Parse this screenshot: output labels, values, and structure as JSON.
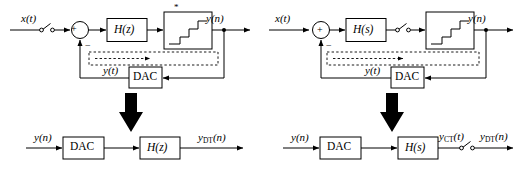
{
  "figure": {
    "type": "block-diagram",
    "stroke_color": "#000000",
    "background_color": "#ffffff",
    "panels": [
      {
        "id": "left",
        "title_hint": "discrete-time controller H(z)",
        "closed_loop": {
          "input_label": "x(t)",
          "sampler_icon": "switch-sampler-icon",
          "summing_junction": {
            "plus_sign": "+",
            "minus_sign": "−"
          },
          "controller_block_label": "H(z)",
          "star_marker": "*",
          "quantizer_icon": "staircase-adc-icon",
          "output_label": "y(n)",
          "feedback_label": "y(t)",
          "dac_block_label": "DAC",
          "dashed_region_icon": "dashed-equivalence-box"
        },
        "big_arrow_icon": "down-arrow-icon",
        "open_loop": {
          "input_label": "y(n)",
          "dac_block_label": "DAC",
          "plant_block_label": "H(z)",
          "output_label_base": "y",
          "output_label_sub": "DT",
          "output_label_arg": "(n)"
        }
      },
      {
        "id": "right",
        "title_hint": "continuous-time controller H(s)",
        "closed_loop": {
          "input_label": "x(t)",
          "summing_junction": {
            "plus_sign": "+",
            "minus_sign": "−"
          },
          "controller_block_label": "H(s)",
          "sampler_icon": "switch-sampler-icon",
          "quantizer_icon": "staircase-adc-icon",
          "output_label": "y(n)",
          "feedback_label": "y(t)",
          "dac_block_label": "DAC",
          "dashed_region_icon": "dashed-equivalence-box"
        },
        "big_arrow_icon": "down-arrow-icon",
        "open_loop": {
          "input_label": "y(n)",
          "dac_block_label": "DAC",
          "plant_block_label": "H(s)",
          "mid_label_base": "y",
          "mid_label_sub": "CT",
          "mid_label_arg": "(t)",
          "sampler_icon": "switch-sampler-icon",
          "output_label_base": "y",
          "output_label_sub": "DT",
          "output_label_arg": "(n)"
        }
      }
    ]
  }
}
